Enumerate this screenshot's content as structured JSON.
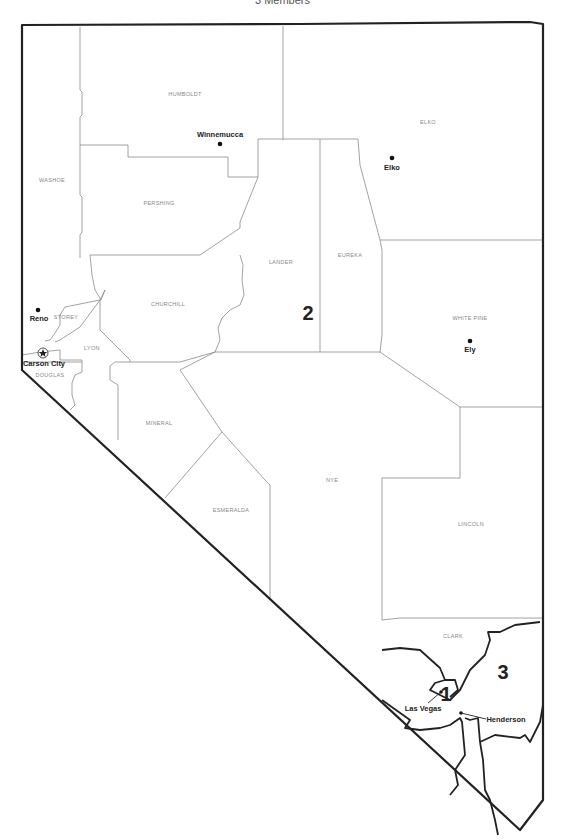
{
  "title": "3 Members",
  "state": "Nevada",
  "counties": [
    {
      "name": "HUMBOLDT",
      "x": 185,
      "y": 96
    },
    {
      "name": "ELKO",
      "x": 428,
      "y": 124
    },
    {
      "name": "WASHOE",
      "x": 52,
      "y": 182
    },
    {
      "name": "PERSHING",
      "x": 159,
      "y": 205
    },
    {
      "name": "LANDER",
      "x": 281,
      "y": 264
    },
    {
      "name": "EUREKA",
      "x": 350,
      "y": 257
    },
    {
      "name": "CHURCHILL",
      "x": 168,
      "y": 306
    },
    {
      "name": "WHITE PINE",
      "x": 470,
      "y": 320
    },
    {
      "name": "STOREY",
      "x": 66,
      "y": 319
    },
    {
      "name": "LYON",
      "x": 92,
      "y": 350
    },
    {
      "name": "DOUGLAS",
      "x": 50,
      "y": 377
    },
    {
      "name": "MINERAL",
      "x": 159,
      "y": 425
    },
    {
      "name": "NYE",
      "x": 332,
      "y": 482
    },
    {
      "name": "ESMERALDA",
      "x": 231,
      "y": 512
    },
    {
      "name": "LINCOLN",
      "x": 471,
      "y": 526
    },
    {
      "name": "CLARK",
      "x": 453,
      "y": 638
    }
  ],
  "cities": [
    {
      "name": "Winnemucca",
      "dot_x": 220,
      "dot_y": 144,
      "label_x": 220,
      "label_y": 137,
      "capital": false
    },
    {
      "name": "Elko",
      "dot_x": 392,
      "dot_y": 158,
      "label_x": 392,
      "label_y": 170,
      "capital": false
    },
    {
      "name": "Reno",
      "dot_x": 38,
      "dot_y": 310,
      "label_x": 40,
      "label_y": 321,
      "capital": false
    },
    {
      "name": "Ely",
      "dot_x": 470,
      "dot_y": 341,
      "label_x": 470,
      "label_y": 352,
      "capital": false
    },
    {
      "name": "Carson City",
      "dot_x": 43,
      "dot_y": 353,
      "label_x": 43,
      "label_y": 366,
      "capital": true
    },
    {
      "name": "Las Vegas",
      "dot_x": 441,
      "dot_y": 692,
      "label_x": 423,
      "label_y": 712,
      "capital": false
    },
    {
      "name": "Henderson",
      "dot_x": 461,
      "dot_y": 713,
      "label_x": 506,
      "label_y": 722,
      "capital": false
    }
  ],
  "districts": [
    {
      "number": "1",
      "x": 446,
      "y": 694
    },
    {
      "number": "2",
      "x": 308,
      "y": 320
    },
    {
      "number": "3",
      "x": 503,
      "y": 679
    }
  ]
}
